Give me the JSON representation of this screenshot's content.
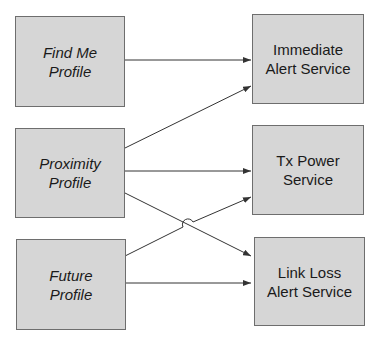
{
  "diagram": {
    "profiles": [
      {
        "id": "find-me",
        "label": "Find Me\nProfile"
      },
      {
        "id": "proximity",
        "label": "Proximity\nProfile"
      },
      {
        "id": "future",
        "label": "Future\nProfile"
      }
    ],
    "services": [
      {
        "id": "immediate-alert",
        "label": "Immediate\nAlert Service"
      },
      {
        "id": "tx-power",
        "label": "Tx Power\nService"
      },
      {
        "id": "link-loss",
        "label": "Link Loss\nAlert Service"
      }
    ],
    "connections": [
      {
        "from": "Find Me Profile",
        "to": "Immediate Alert Service"
      },
      {
        "from": "Proximity Profile",
        "to": "Immediate Alert Service"
      },
      {
        "from": "Proximity Profile",
        "to": "Tx Power Service"
      },
      {
        "from": "Proximity Profile",
        "to": "Link Loss Alert Service"
      },
      {
        "from": "Future Profile",
        "to": "Tx Power Service"
      },
      {
        "from": "Future Profile",
        "to": "Link Loss Alert Service"
      }
    ],
    "colors": {
      "box_fill": "#d6d6d6",
      "box_border": "#6e6e6e",
      "line": "#333333",
      "text": "#1a1a1a"
    }
  }
}
